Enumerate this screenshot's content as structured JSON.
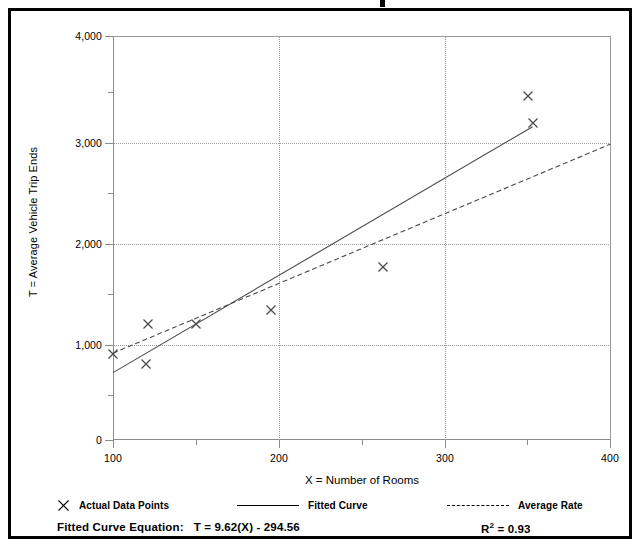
{
  "chart_data": {
    "type": "scatter",
    "title": "",
    "xlabel": "X = Number of Rooms",
    "ylabel": "T = Average Vehicle Trip Ends",
    "xlim": [
      100,
      400
    ],
    "ylim": [
      0,
      4000
    ],
    "xticks": [
      "100",
      "200",
      "300",
      "400"
    ],
    "xtick_values": [
      100,
      200,
      300,
      400
    ],
    "yticks": [
      "0",
      "1,000",
      "2,000",
      "3,000",
      "4,000"
    ],
    "ytick_values": [
      0,
      1000,
      2000,
      3000,
      4000
    ],
    "grid": "dotted gridlines at major x and y ticks",
    "legend_position": "below-axes",
    "series": [
      {
        "name": "Actual Data Points",
        "type": "scatter",
        "marker": "x",
        "points": [
          {
            "x": 100,
            "y": 850
          },
          {
            "x": 120,
            "y": 750
          },
          {
            "x": 121,
            "y": 1150
          },
          {
            "x": 150,
            "y": 1150
          },
          {
            "x": 195,
            "y": 1290
          },
          {
            "x": 263,
            "y": 1710
          },
          {
            "x": 350,
            "y": 3410
          },
          {
            "x": 353,
            "y": 3140
          }
        ]
      },
      {
        "name": "Fitted Curve",
        "type": "line",
        "style": "solid",
        "equation": "T = 9.62(X) - 294.56",
        "endpoints": [
          {
            "x": 100,
            "y": 667
          },
          {
            "x": 353,
            "y": 3102
          }
        ]
      },
      {
        "name": "Average Rate",
        "type": "line",
        "style": "dashed",
        "endpoints": [
          {
            "x": 100,
            "y": 860
          },
          {
            "x": 400,
            "y": 2930
          }
        ]
      }
    ]
  },
  "legend": {
    "items": [
      {
        "label": "Actual Data Points",
        "glyph": "x-marker-icon"
      },
      {
        "label": "Fitted Curve",
        "glyph": "solid-line-icon"
      },
      {
        "label": "Average Rate",
        "glyph": "dashed-line-icon"
      }
    ]
  },
  "footer": {
    "equation_label": "Fitted Curve Equation:",
    "equation_value": "T = 9.62(X) - 294.56",
    "r2_label": "R",
    "r2_exponent": "2",
    "r2_value": "= 0.93"
  }
}
